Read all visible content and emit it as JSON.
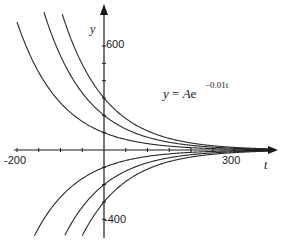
{
  "chart_data": {
    "type": "line",
    "title": "",
    "equation": {
      "lhs": "y",
      "eq": " = ",
      "coef": "A",
      "base": "e",
      "exponent": "−0.01t"
    },
    "xlabel": "t",
    "ylabel": "y",
    "xlim": [
      -200,
      390
    ],
    "ylim": [
      -490,
      760
    ],
    "x_ticks_every": 50,
    "y_ticks_every": 100,
    "x_tick_labels": [
      {
        "value": -200,
        "label": "-200"
      },
      {
        "value": 300,
        "label": "300"
      }
    ],
    "y_tick_labels": [
      {
        "value": 600,
        "label": "600"
      },
      {
        "value": -400,
        "label": "-400"
      }
    ],
    "grid": false,
    "legend": "none",
    "function": "y = A*exp(-0.01*t)",
    "series": [
      {
        "name": "A = 300",
        "A": 300
      },
      {
        "name": "A = 200",
        "A": 200
      },
      {
        "name": "A = 100",
        "A": 100
      },
      {
        "name": "A = -100",
        "A": -100
      },
      {
        "name": "A = -200",
        "A": -200
      },
      {
        "name": "A = -300",
        "A": -300
      }
    ]
  }
}
